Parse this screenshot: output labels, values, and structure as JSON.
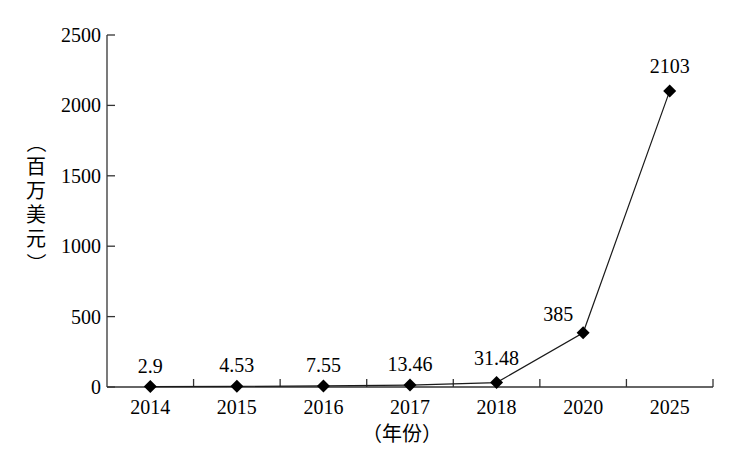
{
  "chart_data": {
    "type": "line",
    "title": "",
    "xlabel": "（年份）",
    "ylabel": "（百万美元）",
    "categories": [
      "2014",
      "2015",
      "2016",
      "2017",
      "2018",
      "2020",
      "2025"
    ],
    "series": [
      {
        "name": "市场规模",
        "values": [
          2.9,
          4.53,
          7.55,
          13.46,
          31.48,
          385,
          2103
        ],
        "marker": "diamond"
      }
    ],
    "data_labels": [
      "2.9",
      "4.53",
      "7.55",
      "13.46",
      "31.48",
      "385",
      "2103"
    ],
    "yticks": [
      "0",
      "500",
      "1000",
      "1500",
      "2000",
      "2500"
    ],
    "ylim": [
      0,
      2500
    ],
    "grid": false,
    "legend": null
  },
  "colors": {
    "line": "#1a1a1a",
    "marker": "#000000",
    "axis": "#333333"
  }
}
